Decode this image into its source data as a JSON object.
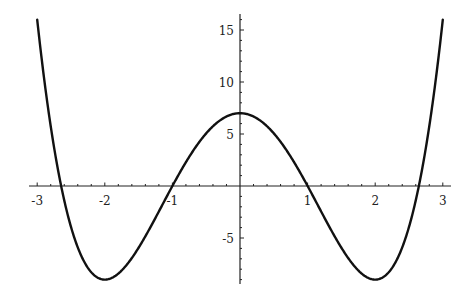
{
  "chart_data": {
    "type": "line",
    "title": "",
    "xlabel": "",
    "ylabel": "",
    "function": "x^4 - 8x^2 + 7",
    "xlim": [
      -3.1,
      3.1
    ],
    "ylim": [
      -9.5,
      16.5
    ],
    "grid": false,
    "legend": null,
    "x_ticks": [
      -3,
      -2,
      -1,
      1,
      2,
      3
    ],
    "x_tick_labels": [
      "-3",
      "-2",
      "-1",
      "1",
      "2",
      "3"
    ],
    "y_ticks": [
      -5,
      5,
      10,
      15
    ],
    "y_tick_labels": [
      "-5",
      "5",
      "10",
      "15"
    ],
    "series": [
      {
        "name": "f(x)",
        "x": [
          -2.97,
          -2.9,
          -2.8,
          -2.7,
          -2.646,
          -2.6,
          -2.5,
          -2.4,
          -2.3,
          -2.2,
          -2.1,
          -2.0,
          -1.9,
          -1.8,
          -1.7,
          -1.6,
          -1.5,
          -1.4,
          -1.3,
          -1.2,
          -1.1,
          -1.0,
          -0.9,
          -0.8,
          -0.7,
          -0.6,
          -0.5,
          -0.4,
          -0.3,
          -0.2,
          -0.1,
          0.0,
          0.1,
          0.2,
          0.3,
          0.4,
          0.5,
          0.6,
          0.7,
          0.8,
          0.9,
          1.0,
          1.1,
          1.2,
          1.3,
          1.4,
          1.5,
          1.6,
          1.7,
          1.8,
          1.9,
          2.0,
          2.1,
          2.2,
          2.3,
          2.4,
          2.5,
          2.6,
          2.646,
          2.7,
          2.8,
          2.9,
          2.97
        ],
        "y": [
          14.25,
          10.45,
          5.75,
          1.82,
          0.0,
          -1.39,
          -3.94,
          -5.9,
          -7.33,
          -8.3,
          -8.83,
          -9.0,
          -8.85,
          -8.42,
          -7.77,
          -6.93,
          -5.94,
          -4.84,
          -3.66,
          -2.45,
          -1.22,
          0.0,
          1.17,
          2.29,
          3.32,
          4.25,
          5.06,
          5.74,
          6.29,
          6.68,
          6.92,
          7.0,
          6.92,
          6.68,
          6.29,
          5.74,
          5.06,
          4.25,
          3.32,
          2.29,
          1.17,
          0.0,
          -1.22,
          -2.45,
          -3.66,
          -4.84,
          -5.94,
          -6.93,
          -7.77,
          -8.42,
          -8.85,
          -9.0,
          -8.83,
          -8.3,
          -7.33,
          -5.9,
          -3.94,
          -1.39,
          0.0,
          1.82,
          5.75,
          10.45,
          14.25
        ]
      }
    ],
    "roots": [
      -2.646,
      -1,
      1,
      2.646
    ],
    "local_max": {
      "x": 0,
      "y": 7
    },
    "local_mins": [
      {
        "x": -2,
        "y": -9
      },
      {
        "x": 2,
        "y": -9
      }
    ]
  },
  "layout": {
    "origin_px": [
      240,
      186
    ],
    "x_px_per_unit": 67.6,
    "y_px_per_unit": 10.4,
    "x_axis_px_range": [
      29,
      451
    ],
    "y_axis_px_range": [
      14,
      284
    ],
    "curve_x_range": [
      -3.0,
      3.0
    ],
    "minor_tick_step": 0.2,
    "minor_tick_step_y": 1,
    "colors": {
      "axis": "#222222",
      "curve": "#111111",
      "background": "#ffffff"
    }
  }
}
